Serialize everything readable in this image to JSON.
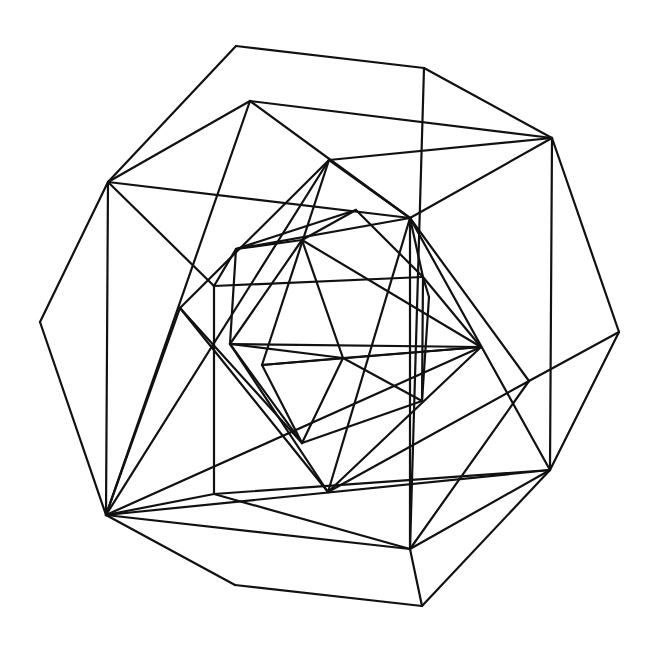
{
  "diagram": {
    "title": "",
    "stroke_color": "#111111",
    "background_color": "#ffffff",
    "vertices": {
      "A": [
        236,
        46
      ],
      "B": [
        424,
        68
      ],
      "C": [
        552,
        138
      ],
      "D": [
        619,
        332
      ],
      "E": [
        550,
        470
      ],
      "F": [
        422,
        606
      ],
      "G": [
        235,
        585
      ],
      "H": [
        106,
        515
      ],
      "I": [
        40,
        322
      ],
      "J": [
        108,
        182
      ],
      "K": [
        250,
        101
      ],
      "L": [
        410,
        218
      ],
      "M": [
        214,
        494
      ],
      "N": [
        410,
        549
      ],
      "O": [
        529,
        381
      ],
      "P": [
        329,
        160
      ],
      "Q": [
        356,
        210
      ],
      "R": [
        302,
        240
      ],
      "S": [
        236,
        249
      ],
      "T": [
        214,
        286
      ],
      "U": [
        180,
        308
      ],
      "V": [
        230,
        344
      ],
      "W": [
        262,
        365
      ],
      "X": [
        343,
        358
      ],
      "Y": [
        481,
        347
      ],
      "Z": [
        423,
        277
      ],
      "AA": [
        429,
        297
      ],
      "AB": [
        422,
        401
      ],
      "AC": [
        302,
        443
      ],
      "AD": [
        328,
        492
      ]
    },
    "edges": [
      [
        "A",
        "B"
      ],
      [
        "B",
        "C"
      ],
      [
        "C",
        "D"
      ],
      [
        "D",
        "E"
      ],
      [
        "E",
        "F"
      ],
      [
        "F",
        "G"
      ],
      [
        "G",
        "H"
      ],
      [
        "H",
        "I"
      ],
      [
        "I",
        "J"
      ],
      [
        "J",
        "A"
      ],
      [
        "B",
        "N"
      ],
      [
        "K",
        "C"
      ],
      [
        "J",
        "K"
      ],
      [
        "J",
        "L"
      ],
      [
        "J",
        "H"
      ],
      [
        "J",
        "T"
      ],
      [
        "K",
        "L"
      ],
      [
        "K",
        "H"
      ],
      [
        "C",
        "L"
      ],
      [
        "C",
        "E"
      ],
      [
        "D",
        "O"
      ],
      [
        "O",
        "L"
      ],
      [
        "O",
        "N"
      ],
      [
        "E",
        "N"
      ],
      [
        "E",
        "H"
      ],
      [
        "E",
        "L"
      ],
      [
        "N",
        "H"
      ],
      [
        "N",
        "F"
      ],
      [
        "N",
        "M"
      ],
      [
        "M",
        "H"
      ],
      [
        "M",
        "T"
      ],
      [
        "M",
        "E"
      ],
      [
        "L",
        "N"
      ],
      [
        "L",
        "S"
      ],
      [
        "L",
        "AD"
      ],
      [
        "L",
        "Z"
      ],
      [
        "H",
        "P"
      ],
      [
        "H",
        "U"
      ],
      [
        "H",
        "Y"
      ],
      [
        "P",
        "C"
      ],
      [
        "P",
        "U"
      ],
      [
        "P",
        "W"
      ],
      [
        "P",
        "L"
      ],
      [
        "Q",
        "S"
      ],
      [
        "Q",
        "Z"
      ],
      [
        "Q",
        "R"
      ],
      [
        "S",
        "R"
      ],
      [
        "S",
        "V"
      ],
      [
        "S",
        "T"
      ],
      [
        "R",
        "V"
      ],
      [
        "R",
        "X"
      ],
      [
        "R",
        "Y"
      ],
      [
        "T",
        "Z"
      ],
      [
        "U",
        "AC"
      ],
      [
        "U",
        "AD"
      ],
      [
        "V",
        "Y"
      ],
      [
        "V",
        "X"
      ],
      [
        "V",
        "AC"
      ],
      [
        "V",
        "AD"
      ],
      [
        "W",
        "Y"
      ],
      [
        "W",
        "AC"
      ],
      [
        "W",
        "X"
      ],
      [
        "X",
        "AB"
      ],
      [
        "X",
        "AC"
      ],
      [
        "X",
        "Y"
      ],
      [
        "Y",
        "AD"
      ],
      [
        "Y",
        "Z"
      ],
      [
        "Z",
        "AA"
      ],
      [
        "AA",
        "AB"
      ],
      [
        "AB",
        "AC"
      ],
      [
        "AB",
        "Z"
      ],
      [
        "AD",
        "O"
      ]
    ]
  }
}
